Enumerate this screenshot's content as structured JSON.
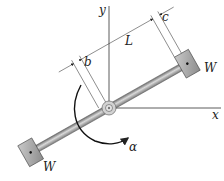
{
  "diagram": {
    "labels": {
      "y_axis": "y",
      "x_axis": "x",
      "weight_upper": "W",
      "weight_lower": "W",
      "dim_b": "b",
      "dim_L": "L",
      "dim_c": "c",
      "angular_accel": "α"
    },
    "colors": {
      "bar": "#8a8a8a",
      "bar_highlight": "#d8d8d8",
      "weight": "#a0a0a0",
      "line": "#333333",
      "hub": "#c8c8c8"
    }
  }
}
